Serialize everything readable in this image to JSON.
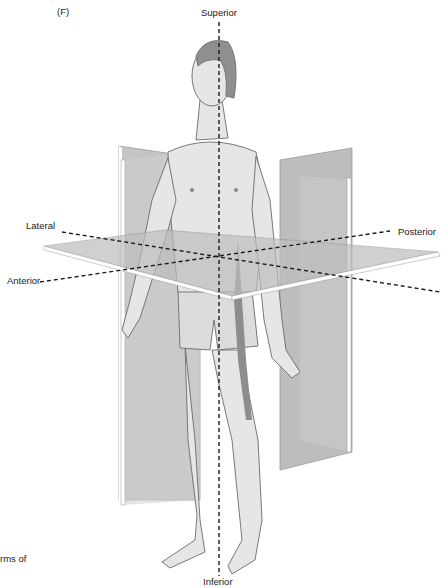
{
  "figure": {
    "panel_label": "(F)",
    "caption_fragment": "rms of",
    "labels": {
      "superior": "Superior",
      "inferior": "Inferior",
      "lateral": "Lateral",
      "posterior": "Posterior",
      "anterior": "Anterior"
    },
    "colors": {
      "plane_fill": "#c8c8c8",
      "plane_dark": "#a9a9a9",
      "plane_edge": "#ffffff",
      "skin": "#e4e4e4",
      "outline": "#6b6b6b",
      "hair": "#8a8a8a",
      "axis_dash": "#1a1a1a"
    }
  }
}
